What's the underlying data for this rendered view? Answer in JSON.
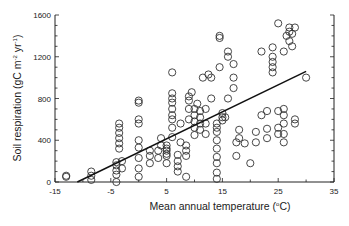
{
  "chart_data": {
    "type": "scatter",
    "title": "",
    "xlabel": "Mean annual temperature (°C)",
    "ylabel": "Soil respiration (gC m-2 yr-1)",
    "xlabel_parts": {
      "main": "Mean annual temperature (",
      "sup": "o",
      "tail": "C)"
    },
    "ylabel_parts": {
      "a": "Soil respiration (gC m",
      "sup1": "-2",
      "b": " yr",
      "sup2": "-1",
      "c": ")"
    },
    "xlim": [
      -15,
      35
    ],
    "ylim": [
      0,
      1600
    ],
    "xticks": [
      -15,
      -5,
      5,
      15,
      25,
      35
    ],
    "yticks": [
      0,
      400,
      800,
      1200,
      1600
    ],
    "x_minor_step": 5,
    "y_minor_step": 100,
    "grid": false,
    "legend": null,
    "marker": "open-circle",
    "trendline": {
      "x": [
        -11,
        30
      ],
      "y": [
        0,
        1060
      ]
    },
    "points": [
      [
        -13,
        50
      ],
      [
        -13,
        60
      ],
      [
        -8.5,
        20
      ],
      [
        -8.5,
        60
      ],
      [
        -8.5,
        100
      ],
      [
        -4,
        0
      ],
      [
        -4,
        70
      ],
      [
        -4,
        110
      ],
      [
        -4,
        160
      ],
      [
        -4,
        190
      ],
      [
        -3.5,
        320
      ],
      [
        -3.5,
        370
      ],
      [
        -3.5,
        420
      ],
      [
        -3.5,
        470
      ],
      [
        -3.5,
        520
      ],
      [
        -3.5,
        560
      ],
      [
        -3,
        130
      ],
      [
        -3,
        200
      ],
      [
        0,
        50
      ],
      [
        0,
        130
      ],
      [
        0,
        230
      ],
      [
        0,
        330
      ],
      [
        0,
        400
      ],
      [
        0,
        560
      ],
      [
        0,
        600
      ],
      [
        0,
        760
      ],
      [
        0,
        780
      ],
      [
        2,
        180
      ],
      [
        2,
        250
      ],
      [
        2,
        300
      ],
      [
        3.5,
        230
      ],
      [
        3.5,
        300
      ],
      [
        4,
        350
      ],
      [
        4,
        420
      ],
      [
        5,
        180
      ],
      [
        5,
        250
      ],
      [
        5,
        270
      ],
      [
        5,
        300
      ],
      [
        5,
        320
      ],
      [
        5,
        350
      ],
      [
        6,
        430
      ],
      [
        6,
        520
      ],
      [
        6,
        600
      ],
      [
        6,
        640
      ],
      [
        6,
        700
      ],
      [
        6,
        760
      ],
      [
        6,
        800
      ],
      [
        6,
        850
      ],
      [
        6,
        1050
      ],
      [
        7,
        100
      ],
      [
        7,
        150
      ],
      [
        7,
        200
      ],
      [
        7,
        260
      ],
      [
        7.5,
        380
      ],
      [
        7.5,
        560
      ],
      [
        8.5,
        50
      ],
      [
        8.5,
        250
      ],
      [
        8.5,
        300
      ],
      [
        8.5,
        350
      ],
      [
        9,
        600
      ],
      [
        9,
        700
      ],
      [
        9,
        780
      ],
      [
        9,
        820
      ],
      [
        9.5,
        860
      ],
      [
        10,
        450
      ],
      [
        10,
        520
      ],
      [
        10,
        580
      ],
      [
        10,
        640
      ],
      [
        10,
        700
      ],
      [
        10.5,
        750
      ],
      [
        11,
        500
      ],
      [
        11,
        560
      ],
      [
        11,
        620
      ],
      [
        11,
        680
      ],
      [
        11.5,
        1000
      ],
      [
        12,
        460
      ],
      [
        12,
        560
      ],
      [
        12,
        700
      ],
      [
        12.5,
        1030
      ],
      [
        13,
        800
      ],
      [
        13,
        1000
      ],
      [
        14,
        30
      ],
      [
        14,
        90
      ],
      [
        14,
        180
      ],
      [
        14,
        240
      ],
      [
        14,
        320
      ],
      [
        14,
        400
      ],
      [
        14,
        480
      ],
      [
        14,
        520
      ],
      [
        14,
        560
      ],
      [
        14.5,
        1100
      ],
      [
        14.5,
        1380
      ],
      [
        14.5,
        1400
      ],
      [
        15,
        590
      ],
      [
        15,
        620
      ],
      [
        15,
        660
      ],
      [
        15.5,
        620
      ],
      [
        16,
        1200
      ],
      [
        16,
        1250
      ],
      [
        16,
        800
      ],
      [
        17,
        1130
      ],
      [
        17,
        900
      ],
      [
        17,
        1000
      ],
      [
        17.5,
        380
      ],
      [
        17.5,
        250
      ],
      [
        18,
        420
      ],
      [
        18,
        500
      ],
      [
        19,
        370
      ],
      [
        20,
        180
      ],
      [
        21,
        380
      ],
      [
        21,
        480
      ],
      [
        22,
        640
      ],
      [
        22,
        1250
      ],
      [
        23,
        420
      ],
      [
        23,
        510
      ],
      [
        23,
        680
      ],
      [
        24,
        1290
      ],
      [
        24,
        1050
      ],
      [
        24,
        1100
      ],
      [
        24,
        1150
      ],
      [
        24,
        1200
      ],
      [
        25,
        460
      ],
      [
        25,
        520
      ],
      [
        25,
        680
      ],
      [
        25,
        1520
      ],
      [
        26,
        380
      ],
      [
        26,
        460
      ],
      [
        26,
        560
      ],
      [
        26,
        640
      ],
      [
        26,
        700
      ],
      [
        26,
        1250
      ],
      [
        26.5,
        1400
      ],
      [
        27,
        1440
      ],
      [
        27,
        1480
      ],
      [
        27,
        1350
      ],
      [
        27.5,
        1300
      ],
      [
        27.5,
        1420
      ],
      [
        28,
        560
      ],
      [
        28,
        600
      ],
      [
        28,
        1480
      ],
      [
        30,
        1000
      ]
    ]
  }
}
